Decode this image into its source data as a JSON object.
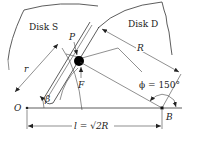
{
  "diagram": {
    "disk_s_label": "Disk S",
    "disk_d_label": "Disk D",
    "point_p_label": "P",
    "r_label": "r",
    "R_label": "R",
    "v_label": "F",
    "beta_label": "β",
    "phi_label": "ϕ = 150°",
    "o_label": "O",
    "b_label": "B",
    "l_label": "l = √2R",
    "colors": {
      "line": "#333333",
      "ball": "#000000",
      "background": "#ffffff"
    }
  }
}
